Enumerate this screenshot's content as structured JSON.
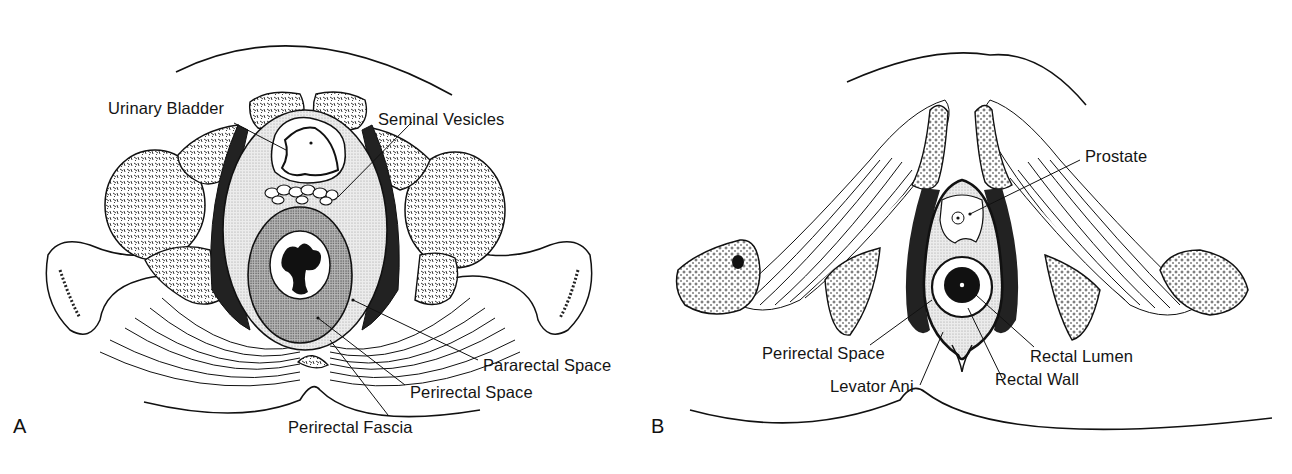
{
  "figure": {
    "panels": [
      {
        "id": "A",
        "letter": "A",
        "labels": {
          "urinary_bladder": "Urinary Bladder",
          "seminal_vesicles": "Seminal Vesicles",
          "pararectal_space": "Pararectal Space",
          "perirectal_space": "Perirectal Space",
          "perirectal_fascia": "Perirectal Fascia"
        }
      },
      {
        "id": "B",
        "letter": "B",
        "labels": {
          "prostate": "Prostate",
          "perirectal_space": "Perirectal Space",
          "levator_ani": "Levator Ani",
          "rectal_wall": "Rectal Wall",
          "rectal_lumen": "Rectal Lumen"
        }
      }
    ],
    "colors": {
      "ink": "#141414",
      "stipple_light": "#d9d9d9",
      "stipple_dark": "#a8a8a8",
      "background": "#ffffff"
    }
  }
}
